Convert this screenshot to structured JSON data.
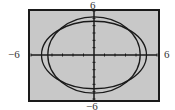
{
  "chart_data": {
    "type": "line",
    "title": "",
    "window": {
      "xmin": -6,
      "xmax": 6,
      "ymin": -6,
      "ymax": 6,
      "xscl": 1,
      "yscl": 1
    },
    "tick_labels": {
      "top": "6",
      "bottom": "-6",
      "left": "-6",
      "right": "6"
    },
    "xlabel": "",
    "ylabel": "",
    "xlim": [
      -6,
      6
    ],
    "ylim": [
      -6,
      6
    ],
    "grid": false,
    "legend": null,
    "series": [
      {
        "name": "ellipse-wide",
        "shape": "ellipse",
        "center": [
          0,
          0
        ],
        "semi_axis_x": 5.0,
        "semi_axis_y": 4.6,
        "note": "estimated from pixels"
      },
      {
        "name": "ellipse-tall",
        "shape": "ellipse",
        "center": [
          0,
          0
        ],
        "semi_axis_x": 4.4,
        "semi_axis_y": 5.2,
        "note": "estimated from pixels"
      }
    ]
  },
  "labels": {
    "top": "6",
    "bottom": "−6",
    "left": "−6",
    "right": "6"
  },
  "colors": {
    "screen_bg": "#c8c8c8",
    "frame": "#1a1a1a",
    "curve": "#1a1a1a",
    "axis": "#1a1a1a"
  }
}
